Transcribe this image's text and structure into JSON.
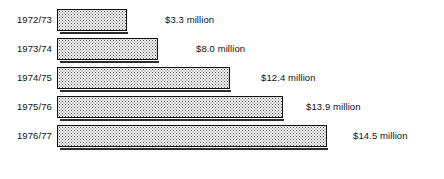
{
  "chart_data": {
    "type": "bar",
    "orientation": "horizontal",
    "title": "",
    "subtitle": "",
    "xlabel": "",
    "ylabel": "",
    "grid": false,
    "legend": null,
    "axis_visible": false,
    "unit": "million",
    "currency": "$",
    "xlim": [
      0,
      16.5
    ],
    "categories": [
      "1972/73",
      "1973/74",
      "1974/75",
      "1975/76",
      "1976/77"
    ],
    "values": [
      3.3,
      8.0,
      12.4,
      13.9,
      14.5
    ],
    "data_labels": [
      "$3.3 million",
      "$8.0 million",
      "$12.4 million",
      "$13.9 million",
      "$14.5 million"
    ],
    "series": [
      {
        "name": "Amount",
        "values": [
          3.3,
          8.0,
          12.4,
          13.9,
          14.5
        ]
      }
    ],
    "bar_fill": "halftone-dot-pattern",
    "bar_border_color": "#111111",
    "bar_fill_color": "#fbfbfb",
    "bar_dot_color": "#4a4a4a",
    "text_color": "#111111",
    "background_color": "#ffffff"
  },
  "rows": [
    {
      "category": "1972/73",
      "value_label": "$3.3 million",
      "bar_width_px": 70,
      "label_left_px": 165,
      "top_px": 8
    },
    {
      "category": "1973/74",
      "value_label": "$8.0 million",
      "bar_width_px": 101,
      "label_left_px": 196,
      "top_px": 37
    },
    {
      "category": "1974/75",
      "value_label": "$12.4 million",
      "bar_width_px": 173,
      "label_left_px": 261,
      "top_px": 66
    },
    {
      "category": "1975/76",
      "value_label": "$13.9 million",
      "bar_width_px": 226,
      "label_left_px": 306,
      "top_px": 95
    },
    {
      "category": "1976/77",
      "value_label": "$14.5 million",
      "bar_width_px": 270,
      "label_left_px": 353,
      "top_px": 124
    }
  ]
}
